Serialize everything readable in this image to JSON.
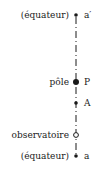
{
  "diagram": {
    "points": [
      {
        "id": "a_prime",
        "left_label": "(équateur)",
        "right_label": "a′",
        "y": 15,
        "marker": "small-dot"
      },
      {
        "id": "P",
        "left_label": "pôle",
        "right_label": "P",
        "y": 82,
        "marker": "large-dot"
      },
      {
        "id": "A",
        "left_label": "",
        "right_label": "A",
        "y": 103,
        "marker": "small-dot"
      },
      {
        "id": "observatoire",
        "left_label": "observatoire",
        "right_label": "",
        "y": 135,
        "marker": "open-circle"
      },
      {
        "id": "a",
        "left_label": "(équateur)",
        "right_label": "a",
        "y": 156,
        "marker": "small-dot"
      }
    ],
    "axis": {
      "x": 76,
      "style": "dash-dot",
      "color": "#1a1a1a"
    }
  }
}
